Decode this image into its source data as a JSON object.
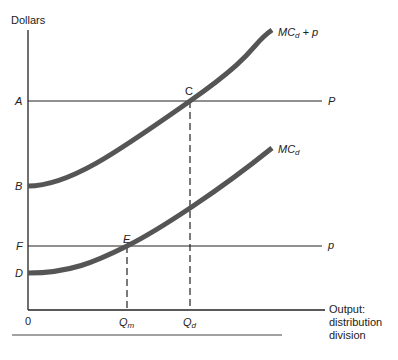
{
  "diagram": {
    "y_axis_label": "Dollars",
    "x_axis_label": [
      "Output:",
      "distribution",
      "division"
    ],
    "origin_label": "0",
    "y_levels": [
      {
        "id": "A",
        "label": "A",
        "line_label": "P",
        "description": "horizontal price line P"
      },
      {
        "id": "B",
        "label": "B",
        "description": "intercept of MC_d + p"
      },
      {
        "id": "F",
        "label": "F",
        "line_label": "p",
        "description": "horizontal line p"
      },
      {
        "id": "D",
        "label": "D",
        "description": "intercept of MC_d"
      }
    ],
    "points": [
      {
        "id": "C",
        "label": "C",
        "description": "intersection of MC_d + p and P"
      },
      {
        "id": "E",
        "label": "E",
        "description": "intersection of MC_d and p"
      }
    ],
    "curves": [
      {
        "id": "mcd_plus_p",
        "label_main": "MC",
        "label_sub": "d",
        "label_tail": " + p"
      },
      {
        "id": "mcd",
        "label_main": "MC",
        "label_sub": "d"
      }
    ],
    "x_ticks": [
      {
        "id": "Qm",
        "label_main": "Q",
        "label_sub": "m"
      },
      {
        "id": "Qd",
        "label_main": "Q",
        "label_sub": "d"
      }
    ],
    "colors": {
      "curve": "#555555",
      "axis": "#222222",
      "text": "#222222"
    }
  }
}
